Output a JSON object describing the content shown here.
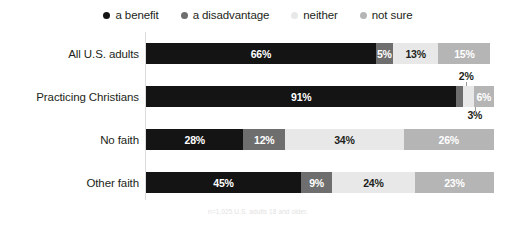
{
  "legend": {
    "items": [
      {
        "label": "a benefit",
        "color": "#141414",
        "icon": "legend-dot-icon"
      },
      {
        "label": "a disadvantage",
        "color": "#6e6e6e",
        "icon": "legend-dot-icon"
      },
      {
        "label": "neither",
        "color": "#e8e8e8",
        "icon": "legend-dot-icon"
      },
      {
        "label": "not sure",
        "color": "#b5b5b5",
        "icon": "legend-dot-icon"
      }
    ]
  },
  "footnote": "n=1,025 U.S. adults 18 and older.",
  "chart_data": {
    "type": "bar",
    "title": "",
    "subtitle": "",
    "orientation": "horizontal",
    "stacked": true,
    "normalized_percent": true,
    "xlabel": "",
    "ylabel": "",
    "xlim": [
      0,
      100
    ],
    "grid": false,
    "legend_position": "top-center",
    "categories": [
      "All U.S. adults",
      "Practicing Christians",
      "No faith",
      "Other faith"
    ],
    "series": [
      {
        "name": "a benefit",
        "color": "#141414",
        "values": [
          66,
          91,
          28,
          45
        ]
      },
      {
        "name": "a disadvantage",
        "color": "#6e6e6e",
        "values": [
          5,
          2,
          12,
          9
        ]
      },
      {
        "name": "neither",
        "color": "#e8e8e8",
        "values": [
          13,
          3,
          34,
          24
        ]
      },
      {
        "name": "not sure",
        "color": "#b5b5b5",
        "values": [
          15,
          6,
          26,
          23
        ]
      }
    ],
    "rows": [
      {
        "label": "All U.S. adults",
        "segments": [
          {
            "series": "a benefit",
            "value": 66,
            "label": "66%",
            "color": "#141414",
            "text_color": "#ffffff",
            "label_position": "inside"
          },
          {
            "series": "a disadvantage",
            "value": 5,
            "label": "5%",
            "color": "#6e6e6e",
            "text_color": "#ffffff",
            "label_position": "inside"
          },
          {
            "series": "neither",
            "value": 13,
            "label": "13%",
            "color": "#e8e8e8",
            "text_color": "#231f20",
            "label_position": "inside"
          },
          {
            "series": "not sure",
            "value": 15,
            "label": "15%",
            "color": "#b5b5b5",
            "text_color": "#ffffff",
            "label_position": "inside"
          }
        ]
      },
      {
        "label": "Practicing Christians",
        "segments": [
          {
            "series": "a benefit",
            "value": 91,
            "label": "91%",
            "color": "#141414",
            "text_color": "#ffffff",
            "label_position": "inside"
          },
          {
            "series": "a disadvantage",
            "value": 2,
            "label": "2%",
            "color": "#6e6e6e",
            "text_color": "#231f20",
            "label_position": "above"
          },
          {
            "series": "neither",
            "value": 3,
            "label": "3%",
            "color": "#e8e8e8",
            "text_color": "#231f20",
            "label_position": "below"
          },
          {
            "series": "not sure",
            "value": 6,
            "label": "6%",
            "color": "#b5b5b5",
            "text_color": "#ffffff",
            "label_position": "inside"
          }
        ]
      },
      {
        "label": "No faith",
        "segments": [
          {
            "series": "a benefit",
            "value": 28,
            "label": "28%",
            "color": "#141414",
            "text_color": "#ffffff",
            "label_position": "inside"
          },
          {
            "series": "a disadvantage",
            "value": 12,
            "label": "12%",
            "color": "#6e6e6e",
            "text_color": "#ffffff",
            "label_position": "inside"
          },
          {
            "series": "neither",
            "value": 34,
            "label": "34%",
            "color": "#e8e8e8",
            "text_color": "#231f20",
            "label_position": "inside"
          },
          {
            "series": "not sure",
            "value": 26,
            "label": "26%",
            "color": "#b5b5b5",
            "text_color": "#ffffff",
            "label_position": "inside"
          }
        ]
      },
      {
        "label": "Other faith",
        "segments": [
          {
            "series": "a benefit",
            "value": 45,
            "label": "45%",
            "color": "#141414",
            "text_color": "#ffffff",
            "label_position": "inside"
          },
          {
            "series": "a disadvantage",
            "value": 9,
            "label": "9%",
            "color": "#6e6e6e",
            "text_color": "#ffffff",
            "label_position": "inside"
          },
          {
            "series": "neither",
            "value": 24,
            "label": "24%",
            "color": "#e8e8e8",
            "text_color": "#231f20",
            "label_position": "inside"
          },
          {
            "series": "not sure",
            "value": 23,
            "label": "23%",
            "color": "#b5b5b5",
            "text_color": "#ffffff",
            "label_position": "inside"
          }
        ]
      }
    ]
  }
}
